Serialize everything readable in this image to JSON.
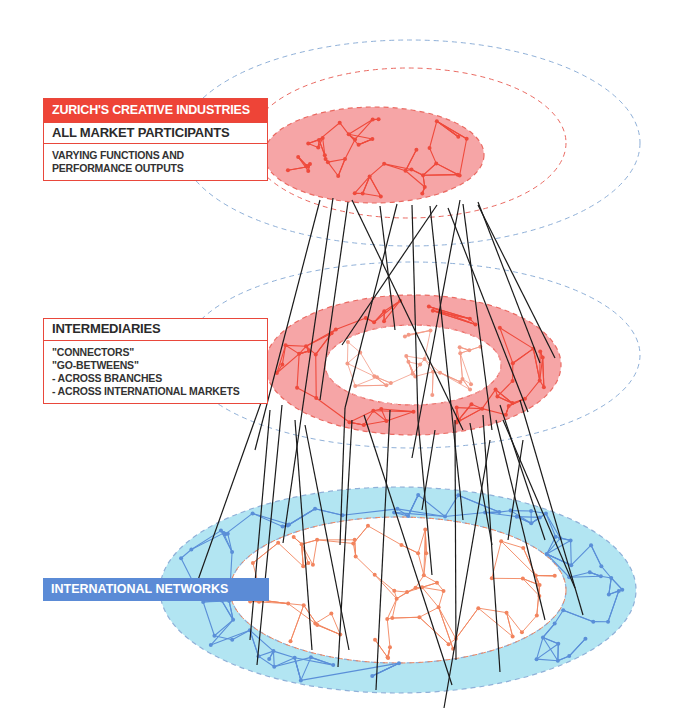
{
  "labels": {
    "top": {
      "header": "ZURICH'S CREATIVE INDUSTRIES",
      "title": "ALL MARKET PARTICIPANTS",
      "description": [
        "VARYING FUNCTIONS AND",
        "PERFORMANCE OUTPUTS"
      ]
    },
    "middle": {
      "title": "INTERMEDIARIES",
      "description": [
        "\"CONNECTORS\"",
        "\"GO-BETWEENS\"",
        "- ACROSS BRANCHES",
        "- ACROSS INTERNATIONAL MARKETS"
      ]
    },
    "bottom": {
      "title": "INTERNATIONAL NETWORKS"
    }
  },
  "colors": {
    "red_accent": "#ee4437",
    "red_fill": "#f6a5a6",
    "red_line": "#ef4a3c",
    "red_light_line": "#f39a86",
    "blue_accent": "#5b8bd6",
    "blue_fill": "#b2e5f2",
    "blue_line": "#5a8fd8",
    "orange_line": "#f2845e",
    "dashed_blue": "#8fb0d8",
    "dashed_red": "#ea6a62",
    "connector": "#1a1a1a"
  },
  "layers": [
    {
      "name": "all-market-participants",
      "shape": "ellipse",
      "cx": 374,
      "cy": 155,
      "rx": 110,
      "ry": 48,
      "halo_red": {
        "cx": 408,
        "cy": 143,
        "rx": 158,
        "ry": 75
      },
      "halo_blue": {
        "cx": 410,
        "cy": 143,
        "rx": 230,
        "ry": 103
      }
    },
    {
      "name": "intermediaries",
      "shape": "ring",
      "cx": 413,
      "cy": 365,
      "rx": 148,
      "ry": 70,
      "inner_rx": 88,
      "inner_ry": 40,
      "halo_blue": {
        "cx": 412,
        "cy": 355,
        "rx": 228,
        "ry": 93
      }
    },
    {
      "name": "international-networks",
      "shape": "ring",
      "cx": 398,
      "cy": 590,
      "rx": 238,
      "ry": 103,
      "inner_rx": 168,
      "inner_ry": 73
    }
  ],
  "connectors": [
    [
      320,
      200,
      255,
      450
    ],
    [
      333,
      198,
      283,
      543
    ],
    [
      348,
      202,
      320,
      400
    ],
    [
      352,
      200,
      463,
      430
    ],
    [
      380,
      206,
      395,
      330
    ],
    [
      397,
      204,
      345,
      408
    ],
    [
      412,
      205,
      418,
      420
    ],
    [
      430,
      206,
      463,
      520
    ],
    [
      437,
      205,
      342,
      345
    ],
    [
      460,
      200,
      412,
      458
    ],
    [
      463,
      204,
      492,
      430
    ],
    [
      478,
      202,
      540,
      363
    ],
    [
      478,
      205,
      555,
      358
    ],
    [
      448,
      208,
      528,
      412
    ],
    [
      262,
      400,
      198,
      580
    ],
    [
      270,
      410,
      250,
      640
    ],
    [
      282,
      405,
      257,
      665
    ],
    [
      295,
      420,
      312,
      650
    ],
    [
      305,
      425,
      349,
      650
    ],
    [
      345,
      408,
      340,
      545
    ],
    [
      352,
      420,
      338,
      667
    ],
    [
      364,
      415,
      452,
      685
    ],
    [
      390,
      410,
      376,
      690
    ],
    [
      418,
      420,
      432,
      575
    ],
    [
      435,
      430,
      422,
      510
    ],
    [
      455,
      420,
      456,
      660
    ],
    [
      470,
      423,
      492,
      545
    ],
    [
      483,
      415,
      500,
      672
    ],
    [
      496,
      420,
      545,
      620
    ],
    [
      503,
      420,
      575,
      588
    ],
    [
      500,
      405,
      545,
      540
    ],
    [
      520,
      400,
      583,
      615
    ],
    [
      523,
      440,
      508,
      540
    ],
    [
      490,
      440,
      444,
      708
    ]
  ],
  "network_seeds": {
    "top": 7,
    "middle": 13,
    "bottom": 29
  }
}
